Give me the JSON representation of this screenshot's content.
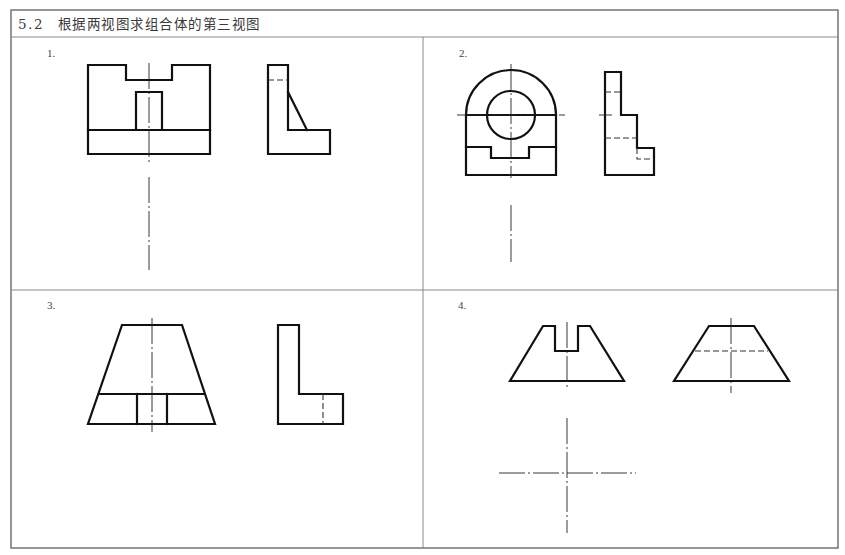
{
  "header": {
    "section_number": "5.2",
    "title": "根据两视图求组合体的第三视图"
  },
  "problems": [
    {
      "label": "1.",
      "views": [
        "front-view",
        "left-side-view"
      ],
      "missing": "top-view"
    },
    {
      "label": "2.",
      "views": [
        "front-view",
        "left-side-view"
      ],
      "missing": "top-view"
    },
    {
      "label": "3.",
      "views": [
        "front-view",
        "left-side-view"
      ],
      "missing": "top-view"
    },
    {
      "label": "4.",
      "views": [
        "front-view",
        "left-side-view"
      ],
      "missing": "top-view"
    }
  ],
  "colors": {
    "line": "#111111",
    "frame": "#6a6a6a",
    "background": "#ffffff"
  }
}
